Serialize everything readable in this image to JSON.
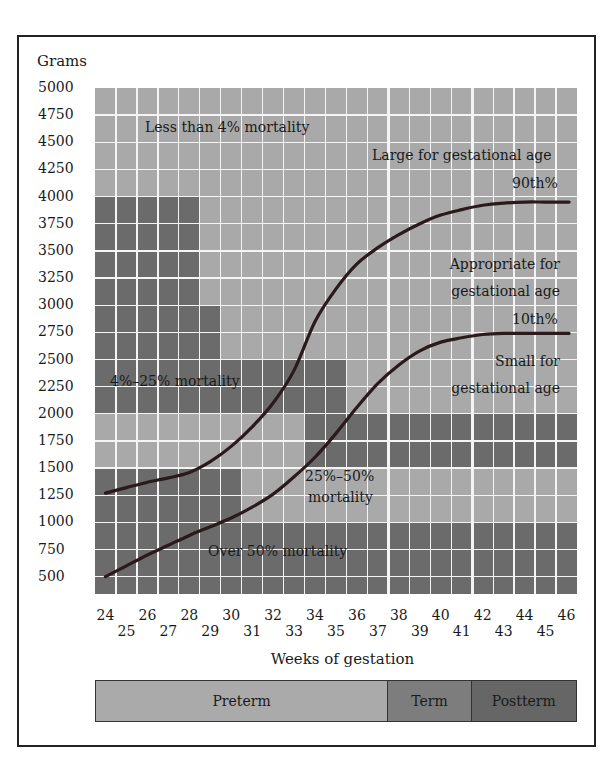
{
  "colors": {
    "light": "#a9a9a9",
    "medium": "#8e8e8e",
    "dark": "#6b6b6b",
    "curve": "#2a1a1c",
    "preterm": "#aaaaaa",
    "term": "#7d7d7d",
    "postterm": "#666666"
  },
  "y_axis": {
    "title": "Grams",
    "ticks": [
      "5000",
      "4750",
      "4500",
      "4250",
      "4000",
      "3750",
      "3500",
      "3250",
      "3000",
      "2750",
      "2500",
      "2250",
      "2000",
      "1750",
      "1500",
      "1250",
      "1000",
      "750",
      "500"
    ]
  },
  "x_axis": {
    "title": "Weeks of gestation",
    "ticks_top": [
      "24",
      "26",
      "28",
      "30",
      "32",
      "34",
      "36",
      "38",
      "40",
      "42",
      "44",
      "46"
    ],
    "ticks_bottom": [
      "25",
      "27",
      "29",
      "31",
      "33",
      "35",
      "37",
      "39",
      "41",
      "43",
      "45"
    ]
  },
  "regions": {
    "low_mortality": "Less than 4% mortality",
    "mid_mortality": "4%–25% mortality",
    "high_mortality_1": "25%–50%",
    "high_mortality_2": "mortality",
    "very_high_mortality": "Over 50% mortality",
    "lga": "Large for gestational age",
    "p90": "90th%",
    "aga_1": "Appropriate for",
    "aga_2": "gestational age",
    "p10": "10th%",
    "sga_1": "Small for",
    "sga_2": "gestational age"
  },
  "phases": [
    {
      "label": "Preterm",
      "from_week": 23.5,
      "to_week": 37.5
    },
    {
      "label": "Term",
      "from_week": 37.5,
      "to_week": 41.5
    },
    {
      "label": "Postterm",
      "from_week": 41.5,
      "to_week": 46.5
    }
  ],
  "chart_data": {
    "type": "line",
    "title": "",
    "xlabel": "Weeks of gestation",
    "ylabel": "Grams",
    "xlim": [
      23.5,
      46.5
    ],
    "ylim": [
      250,
      5000
    ],
    "grid": true,
    "x": [
      24,
      25,
      26,
      27,
      28,
      29,
      30,
      31,
      32,
      33,
      34,
      35,
      36,
      37,
      38,
      39,
      40,
      41,
      42,
      43,
      44,
      45,
      46
    ],
    "series": [
      {
        "name": "90th%",
        "values": [
          1270,
          1320,
          1370,
          1410,
          1460,
          1560,
          1700,
          1880,
          2100,
          2400,
          2850,
          3150,
          3380,
          3530,
          3650,
          3750,
          3830,
          3880,
          3920,
          3940,
          3950,
          3950,
          3950
        ]
      },
      {
        "name": "10th%",
        "values": [
          500,
          600,
          700,
          790,
          880,
          960,
          1040,
          1140,
          1260,
          1420,
          1600,
          1820,
          2060,
          2280,
          2450,
          2580,
          2660,
          2700,
          2730,
          2740,
          2740,
          2740,
          2740
        ]
      }
    ],
    "annotations": [
      "Less than 4% mortality",
      "4%–25% mortality",
      "25%–50% mortality",
      "Over 50% mortality",
      "Large for gestational age",
      "Appropriate for gestational age",
      "Small for gestational age"
    ],
    "phase_bands": [
      "Preterm",
      "Term",
      "Postterm"
    ]
  }
}
